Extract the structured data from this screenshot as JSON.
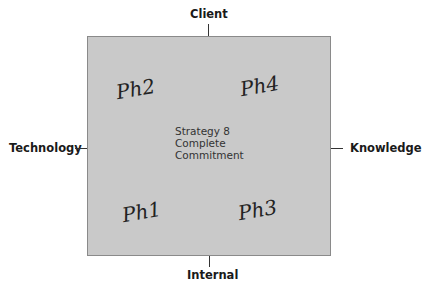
{
  "diagram": {
    "axes": {
      "top": "Client",
      "bottom": "Internal",
      "left": "Technology",
      "right": "Knowledge"
    },
    "center": {
      "line1": "Strategy 8",
      "line2": "Complete",
      "line3": "Commitment"
    },
    "annotations": {
      "top_left": "Ph2",
      "top_right": "Ph4",
      "bottom_left": "Ph1",
      "bottom_right": "Ph3"
    },
    "colors": {
      "box_fill": "#c9c9c9",
      "box_border": "#8a8a8a"
    }
  }
}
